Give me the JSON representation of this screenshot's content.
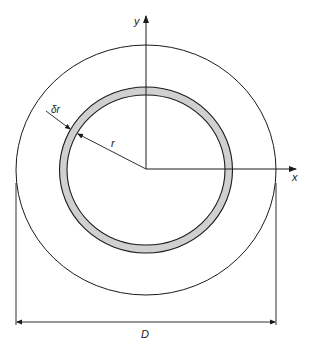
{
  "diagram": {
    "labels": {
      "y_axis": "y",
      "x_axis": "x",
      "radius": "r",
      "thickness": "δr",
      "diameter": "D"
    },
    "colors": {
      "stroke": "#1a1a1a",
      "ring_fill": "#d0d0d0",
      "background": "#ffffff"
    }
  }
}
